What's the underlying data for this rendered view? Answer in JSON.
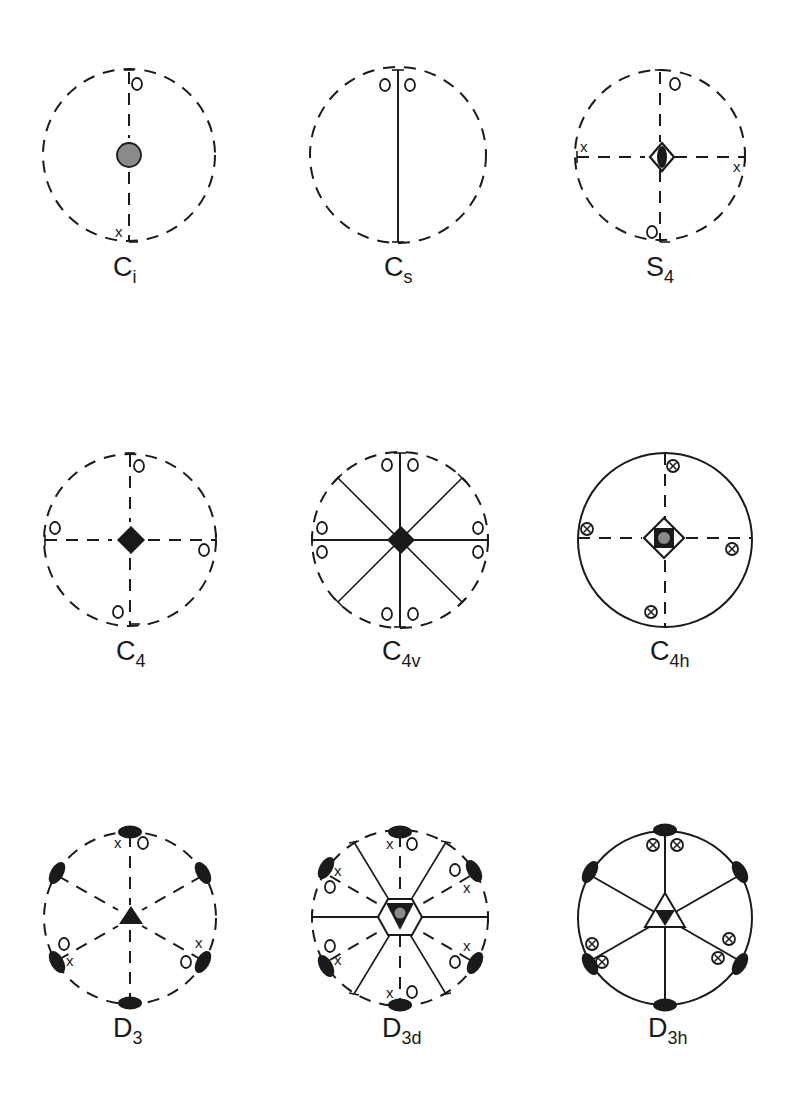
{
  "figure": {
    "colors": {
      "ink": "#1a1a1a",
      "gray_fill": "#8a8a8a",
      "background": "#ffffff"
    },
    "legend_symbols": {
      "open_circle": "point below/above projection plane (o)",
      "cross": "point on opposite hemisphere (x)",
      "circled_cross": "coincident points above and below (⊗)",
      "filled_diamond": "4-fold rotation axis",
      "filled_triangle": "3-fold rotation axis",
      "filled_lens": "2-fold rotation axis",
      "gray_dot": "inversion center"
    },
    "panels": [
      {
        "id": "Ci",
        "base": "C",
        "sub": "i",
        "row": 1,
        "col": 1,
        "boundary": "dashed"
      },
      {
        "id": "Cs",
        "base": "C",
        "sub": "s",
        "row": 1,
        "col": 2,
        "boundary": "dashed"
      },
      {
        "id": "S4",
        "base": "S",
        "sub": "4",
        "row": 1,
        "col": 3,
        "boundary": "dashed"
      },
      {
        "id": "C4",
        "base": "C",
        "sub": "4",
        "row": 2,
        "col": 1,
        "boundary": "dashed"
      },
      {
        "id": "C4v",
        "base": "C",
        "sub": "4v",
        "row": 2,
        "col": 2,
        "boundary": "dashed"
      },
      {
        "id": "C4h",
        "base": "C",
        "sub": "4h",
        "row": 2,
        "col": 3,
        "boundary": "solid"
      },
      {
        "id": "D3",
        "base": "D",
        "sub": "3",
        "row": 3,
        "col": 1,
        "boundary": "dashed"
      },
      {
        "id": "D3d",
        "base": "D",
        "sub": "3d",
        "row": 3,
        "col": 2,
        "boundary": "dashed"
      },
      {
        "id": "D3h",
        "base": "D",
        "sub": "3h",
        "row": 3,
        "col": 3,
        "boundary": "solid"
      }
    ],
    "marks": {
      "o": "o",
      "x": "x"
    }
  }
}
